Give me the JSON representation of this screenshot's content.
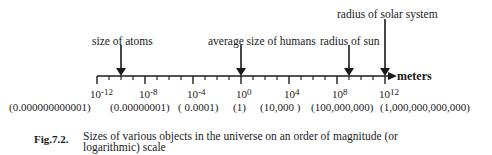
{
  "diagram": {
    "axis": {
      "unit_label": "meters",
      "ticks": [
        {
          "base": "10",
          "exp": "-12",
          "value": "(0.000000000001)"
        },
        {
          "base": "10",
          "exp": "-8",
          "value": "(0.00000001)"
        },
        {
          "base": "10",
          "exp": "-4",
          "value": "( 0.0001)"
        },
        {
          "base": "10",
          "exp": "0",
          "value": "(1)"
        },
        {
          "base": "10",
          "exp": "4",
          "value": "(10,000 )"
        },
        {
          "base": "10",
          "exp": "8",
          "value": "(100,000,000)"
        },
        {
          "base": "10",
          "exp": "12",
          "value": "(1,000,000,000,000)"
        }
      ]
    },
    "markers": [
      {
        "label": "size of atoms",
        "exponent": -10
      },
      {
        "label": "average size of humans",
        "exponent": 0
      },
      {
        "label": "radius of sun",
        "exponent": 9
      },
      {
        "label": "radius of solar system",
        "exponent": 12
      }
    ],
    "colors": {
      "ink": "#1a1a1a",
      "background": "#ffffff"
    }
  },
  "caption": {
    "number": "Fig.7.2.",
    "text_line1": "Sizes of various objects in the universe on an order of magnitude (or",
    "text_line2": "logarithmic) scale"
  }
}
